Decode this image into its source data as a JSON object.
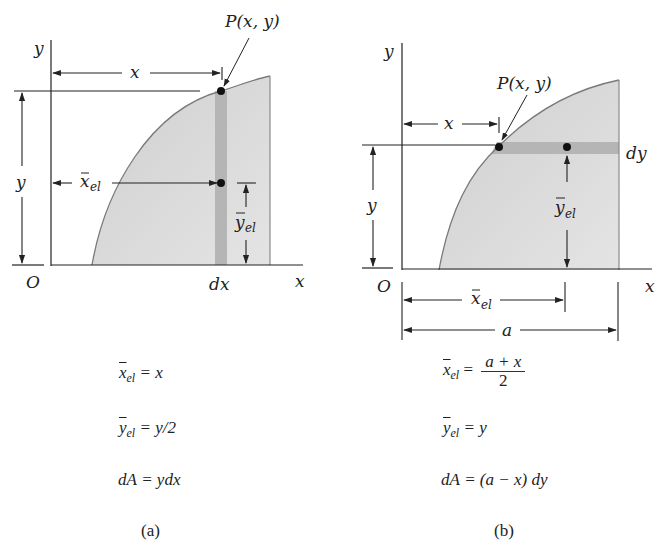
{
  "figure_a": {
    "caption": "(a)",
    "labels": {
      "y_axis": "y",
      "x_axis": "x",
      "origin": "O",
      "point": "P(x, y)",
      "x_dim": "x",
      "y_dim": "y",
      "xel_dim": "x",
      "xel_sub": "el",
      "yel_dim": "y",
      "yel_sub": "el",
      "strip": "dx"
    },
    "equations": [
      {
        "lhs": "x",
        "sub": "el",
        "rhs": "= x"
      },
      {
        "lhs": "y",
        "sub": "el",
        "rhs": "= y/2"
      },
      {
        "lhs": "dA",
        "sub": "",
        "rhs": "= ydx"
      }
    ],
    "strip_orientation": "vertical"
  },
  "figure_b": {
    "caption": "(b)",
    "labels": {
      "y_axis": "y",
      "x_axis": "x",
      "origin": "O",
      "point": "P(x, y)",
      "x_dim": "x",
      "y_dim": "y",
      "xel_dim": "x",
      "xel_sub": "el",
      "yel_dim": "y",
      "yel_sub": "el",
      "a_dim": "a",
      "strip": "dy"
    },
    "equations": [
      {
        "lhs": "x",
        "sub": "el",
        "rhs_prefix": "=",
        "frac_num": "a + x",
        "frac_den": "2"
      },
      {
        "lhs": "y",
        "sub": "el",
        "rhs": "= y"
      },
      {
        "lhs": "dA",
        "sub": "",
        "rhs": "= (a − x) dy"
      }
    ],
    "strip_orientation": "horizontal"
  },
  "colors": {
    "region_fill": "#d4d4d4",
    "region_fill_light": "#e2e2e2",
    "strip_fill": "#b3b3b3",
    "curve": "#7a7a7a",
    "line": "#222222"
  }
}
